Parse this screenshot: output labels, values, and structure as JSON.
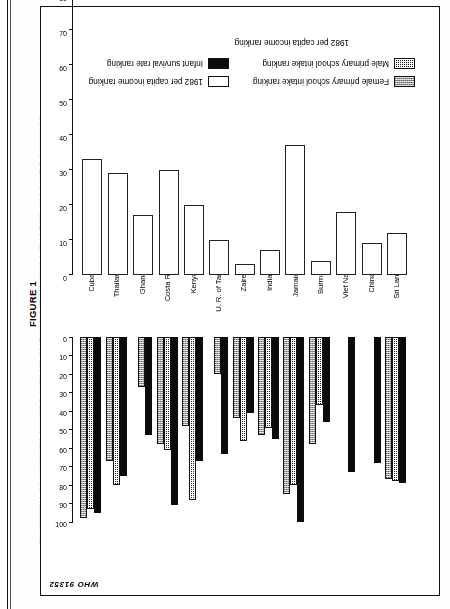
{
  "figure": {
    "number": "FIGURE 1",
    "title": "THIRTEEN COUNTRIES WHERE INFANT SURVIVAL RANKINGS EXCEED INCOME RANKINGS",
    "source_code": "WHO 91352"
  },
  "legend": {
    "male": "Male primary school intake ranking",
    "female": "Female primary school intake ranking",
    "infant": "Infant survival rate ranking",
    "income": "1982 per capita income ranking"
  },
  "axis": {
    "bottom_caption": "1982 per capita income ranking",
    "ticks": [
      "0",
      "10",
      "20",
      "30",
      "40",
      "50",
      "60",
      "70",
      "80",
      "90",
      "100"
    ]
  },
  "chart_data": {
    "type": "bar",
    "title": "THIRTEEN COUNTRIES WHERE INFANT SURVIVAL RANKINGS EXCEED INCOME RANKINGS",
    "xlabel": "",
    "ylabel": "1982 per capita income ranking",
    "ylim": [
      0,
      100
    ],
    "grid": false,
    "legend_position": "top",
    "categories": [
      "Sri Lanka",
      "China",
      "Viet Nam",
      "Burma",
      "Jamaica",
      "India",
      "Zaire",
      "U. R. of Tanzania",
      "Kenya",
      "Costa Rica",
      "Ghana",
      "Thailand",
      "Cuba"
    ],
    "series": [
      {
        "name": "Infant survival rate ranking",
        "values": [
          79,
          68,
          73,
          46,
          100,
          55,
          41,
          63,
          67,
          91,
          53,
          75,
          95
        ]
      },
      {
        "name": "Male primary school intake ranking",
        "values": [
          78,
          0,
          0,
          37,
          80,
          49,
          56,
          0,
          88,
          61,
          0,
          80,
          93
        ]
      },
      {
        "name": "Female primary school intake ranking",
        "values": [
          77,
          0,
          0,
          58,
          85,
          53,
          44,
          20,
          48,
          58,
          27,
          67,
          98
        ]
      },
      {
        "name": "1982 per capita income ranking",
        "values": [
          12,
          9,
          18,
          4,
          37,
          7,
          3,
          10,
          20,
          30,
          17,
          29,
          33
        ]
      }
    ]
  },
  "countries": [
    {
      "label": "Sri Lanka",
      "infant": 79,
      "male": 78,
      "female": 77,
      "income": 12
    },
    {
      "label": "China",
      "infant": 68,
      "male": 0,
      "female": 0,
      "income": 9
    },
    {
      "label": "Viet Nam",
      "infant": 73,
      "male": 0,
      "female": 0,
      "income": 18
    },
    {
      "label": "Burma",
      "infant": 46,
      "male": 37,
      "female": 58,
      "income": 4
    },
    {
      "label": "Jamaica",
      "infant": 100,
      "male": 80,
      "female": 85,
      "income": 37
    },
    {
      "label": "India",
      "infant": 55,
      "male": 49,
      "female": 53,
      "income": 7
    },
    {
      "label": "Zaire",
      "infant": 41,
      "male": 56,
      "female": 44,
      "income": 3
    },
    {
      "label": "U. R. of Tanzania",
      "infant": 63,
      "male": 0,
      "female": 20,
      "income": 10
    },
    {
      "label": "Kenya",
      "infant": 67,
      "male": 88,
      "female": 48,
      "income": 20
    },
    {
      "label": "Costa Rica",
      "infant": 91,
      "male": 61,
      "female": 58,
      "income": 30
    },
    {
      "label": "Ghana",
      "infant": 53,
      "male": 0,
      "female": 27,
      "income": 17
    },
    {
      "label": "Thailand",
      "infant": 75,
      "male": 80,
      "female": 67,
      "income": 29
    },
    {
      "label": "Cuba",
      "infant": 95,
      "male": 93,
      "female": 98,
      "income": 33
    }
  ]
}
